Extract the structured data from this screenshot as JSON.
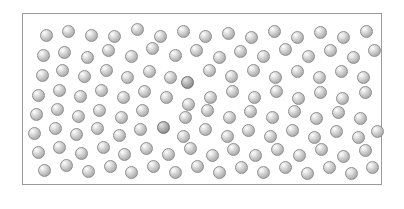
{
  "figure": {
    "kind": "particle-configuration-snapshot",
    "background_color": "#ffffff"
  },
  "box": {
    "name": "simulation-box",
    "x": 22,
    "y": 13,
    "width": 360,
    "height": 172,
    "border_color": "#9a9a9a",
    "border_width": 1,
    "fill_color": "#ffffff"
  },
  "particle_style": {
    "diameter": 13,
    "normal_fill": "#c6c6c6",
    "normal_edge": "#8e8e8e",
    "normal_highlight": "#fdfdfd",
    "marked_fill": "#a2a2a2",
    "marked_edge": "#6f6f6f",
    "marked_highlight": "#e6e6e6",
    "highlight_position": "upper-left"
  },
  "chart_data": {
    "type": "scatter",
    "title": "",
    "xlabel": "",
    "ylabel": "",
    "xlim": [
      22,
      382
    ],
    "ylim": [
      13,
      185
    ],
    "grid": false,
    "legend": "none",
    "marker": "sphere",
    "marker_diameter": 13,
    "series": [
      {
        "name": "particles",
        "count": 124,
        "color": "#c6c6c6",
        "points": [
          [
            46,
            35
          ],
          [
            68,
            31
          ],
          [
            91,
            35
          ],
          [
            114,
            36
          ],
          [
            137,
            29
          ],
          [
            160,
            36
          ],
          [
            183,
            31
          ],
          [
            205,
            36
          ],
          [
            228,
            33
          ],
          [
            251,
            37
          ],
          [
            274,
            31
          ],
          [
            297,
            37
          ],
          [
            320,
            32
          ],
          [
            343,
            37
          ],
          [
            366,
            31
          ],
          [
            43,
            55
          ],
          [
            64,
            52
          ],
          [
            87,
            57
          ],
          [
            108,
            50
          ],
          [
            131,
            56
          ],
          [
            152,
            48
          ],
          [
            175,
            55
          ],
          [
            196,
            50
          ],
          [
            219,
            57
          ],
          [
            240,
            51
          ],
          [
            263,
            56
          ],
          [
            285,
            49
          ],
          [
            308,
            56
          ],
          [
            330,
            50
          ],
          [
            353,
            57
          ],
          [
            374,
            50
          ],
          [
            42,
            75
          ],
          [
            62,
            70
          ],
          [
            84,
            76
          ],
          [
            106,
            70
          ],
          [
            127,
            77
          ],
          [
            149,
            71
          ],
          [
            170,
            77
          ],
          [
            209,
            70
          ],
          [
            231,
            76
          ],
          [
            253,
            70
          ],
          [
            275,
            77
          ],
          [
            297,
            71
          ],
          [
            319,
            77
          ],
          [
            341,
            71
          ],
          [
            363,
            77
          ],
          [
            38,
            95
          ],
          [
            59,
            90
          ],
          [
            80,
            96
          ],
          [
            101,
            90
          ],
          [
            123,
            97
          ],
          [
            144,
            91
          ],
          [
            166,
            97
          ],
          [
            188,
            104
          ],
          [
            210,
            97
          ],
          [
            232,
            91
          ],
          [
            254,
            97
          ],
          [
            276,
            91
          ],
          [
            298,
            98
          ],
          [
            320,
            92
          ],
          [
            342,
            98
          ],
          [
            365,
            92
          ],
          [
            36,
            114
          ],
          [
            57,
            109
          ],
          [
            78,
            116
          ],
          [
            99,
            110
          ],
          [
            121,
            117
          ],
          [
            142,
            110
          ],
          [
            185,
            117
          ],
          [
            207,
            110
          ],
          [
            229,
            117
          ],
          [
            250,
            111
          ],
          [
            272,
            117
          ],
          [
            294,
            111
          ],
          [
            316,
            118
          ],
          [
            338,
            112
          ],
          [
            360,
            118
          ],
          [
            34,
            133
          ],
          [
            55,
            128
          ],
          [
            76,
            134
          ],
          [
            97,
            128
          ],
          [
            119,
            135
          ],
          [
            140,
            129
          ],
          [
            183,
            136
          ],
          [
            205,
            129
          ],
          [
            227,
            136
          ],
          [
            248,
            130
          ],
          [
            270,
            136
          ],
          [
            292,
            130
          ],
          [
            314,
            137
          ],
          [
            336,
            131
          ],
          [
            358,
            137
          ],
          [
            377,
            131
          ],
          [
            38,
            152
          ],
          [
            59,
            147
          ],
          [
            81,
            153
          ],
          [
            103,
            147
          ],
          [
            124,
            154
          ],
          [
            146,
            148
          ],
          [
            168,
            154
          ],
          [
            190,
            148
          ],
          [
            212,
            155
          ],
          [
            233,
            149
          ],
          [
            255,
            155
          ],
          [
            277,
            149
          ],
          [
            299,
            155
          ],
          [
            321,
            149
          ],
          [
            343,
            156
          ],
          [
            365,
            150
          ],
          [
            44,
            170
          ],
          [
            66,
            165
          ],
          [
            88,
            171
          ],
          [
            110,
            166
          ],
          [
            131,
            172
          ],
          [
            153,
            166
          ],
          [
            175,
            172
          ],
          [
            197,
            166
          ],
          [
            219,
            172
          ],
          [
            241,
            167
          ],
          [
            263,
            172
          ],
          [
            285,
            167
          ],
          [
            307,
            173
          ],
          [
            329,
            167
          ],
          [
            351,
            173
          ],
          [
            372,
            167
          ]
        ]
      },
      {
        "name": "marked-particles",
        "count": 2,
        "color": "#a2a2a2",
        "points": [
          [
            187,
            82
          ],
          [
            163,
            127
          ]
        ]
      }
    ]
  }
}
